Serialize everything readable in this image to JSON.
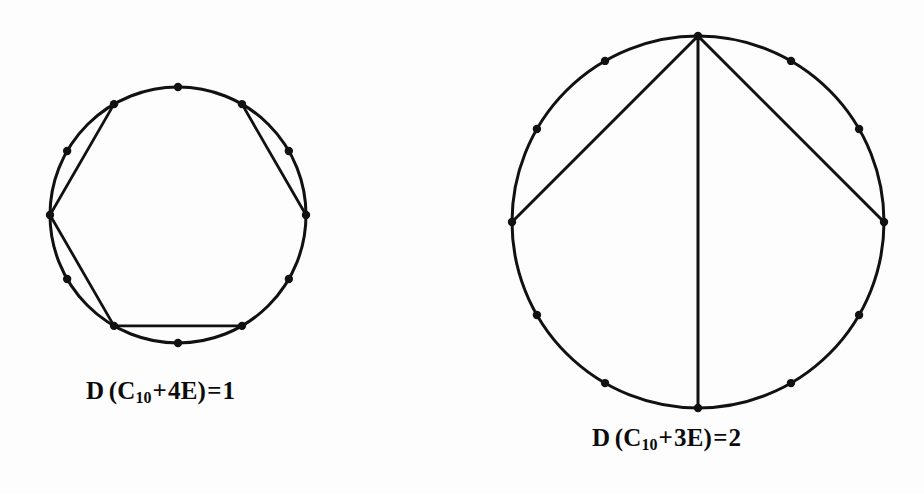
{
  "document": {
    "kind": "mathematical-figure-pair",
    "background_color": "#fdfdfd",
    "ink_color": "#111111",
    "width": 924,
    "height": 494
  },
  "figures": [
    {
      "id": "left",
      "name": "circle-diagram-4E",
      "center_x": 178,
      "center_y": 215,
      "radius": 128,
      "vertex_count": 12,
      "vertex_dot_radius": 4.2,
      "stroke_width": 3.0,
      "chord_stroke_width": 2.8,
      "start_angle_deg": -90,
      "chords": [
        {
          "from": 1,
          "to": 3
        },
        {
          "from": 9,
          "to": 11
        },
        {
          "from": 5,
          "to": 7
        },
        {
          "from": 7,
          "to": 9
        }
      ],
      "caption": {
        "prefix": "D",
        "open": "(",
        "base": "C",
        "subscript": "10",
        "plus": "+",
        "term": "4E",
        "close": ")",
        "equals": "=",
        "value": "1",
        "full_text": "D (C10 + 4E) = 1"
      }
    },
    {
      "id": "right",
      "name": "circle-diagram-3E",
      "center_x": 698,
      "center_y": 222,
      "radius": 186,
      "vertex_count": 12,
      "vertex_dot_radius": 4.2,
      "stroke_width": 3.0,
      "chord_stroke_width": 3.0,
      "start_angle_deg": -90,
      "chords": [
        {
          "from": 0,
          "to": 3
        },
        {
          "from": 0,
          "to": 6
        },
        {
          "from": 0,
          "to": 9
        }
      ],
      "caption": {
        "prefix": "D",
        "open": "(",
        "base": "C",
        "subscript": "10",
        "plus": "+",
        "term": "3E",
        "close": ")",
        "equals": "=",
        "value": "2",
        "full_text": "D (C10 + 3E) = 2"
      }
    }
  ],
  "chart_data": {
    "type": "diagram",
    "title": "",
    "panels": [
      {
        "label": "D (C10 + 4E) = 1",
        "graph": "cycle-with-chords",
        "cycle_length_label": "C10",
        "extra_edges": 4,
        "dominating_number": 1,
        "drawn_vertices": 12,
        "chord_pairs": [
          [
            1,
            3
          ],
          [
            5,
            7
          ],
          [
            7,
            9
          ],
          [
            9,
            11
          ]
        ]
      },
      {
        "label": "D (C10 + 3E) = 2",
        "graph": "cycle-with-chords",
        "cycle_length_label": "C10",
        "extra_edges": 3,
        "dominating_number": 2,
        "drawn_vertices": 12,
        "chord_pairs": [
          [
            0,
            3
          ],
          [
            0,
            6
          ],
          [
            0,
            9
          ]
        ]
      }
    ]
  }
}
